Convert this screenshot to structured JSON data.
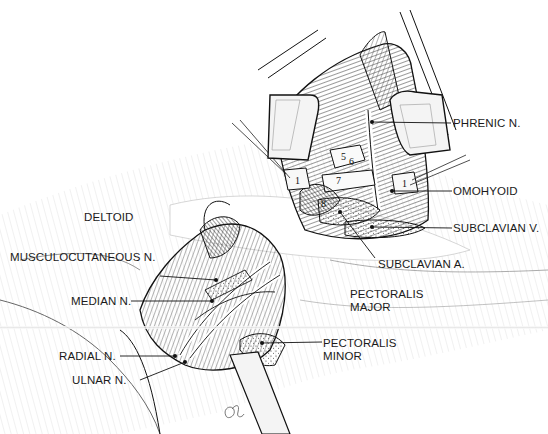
{
  "figure": {
    "type": "anatomical surgical illustration",
    "signature": "artist monogram"
  },
  "labels": {
    "phrenic": "PHRENIC N.",
    "omohyoid": "OMOHYOID",
    "subclavian_v": "SUBCLAVIAN V.",
    "subclavian_a": "SUBCLAVIAN A.",
    "deltoid": "DELTOID",
    "musculocutaneous": "MUSCULOCUTANEOUS N.",
    "median": "MEDIAN N.",
    "pectoralis_major_1": "PECTORALIS",
    "pectoralis_major_2": "MAJOR",
    "pectoralis_minor_1": "PECTORALIS",
    "pectoralis_minor_2": "MINOR",
    "radial": "RADIAL N.",
    "ulnar": "ULNAR N."
  },
  "markers": {
    "m1_left": "1",
    "m1_right": "1",
    "m5": "5",
    "m6": "6",
    "m7": "7",
    "m8": "8"
  },
  "colors": {
    "ink": "#1a1a1a",
    "paper": "#ffffff",
    "retractor_fill": "#f4f4f4"
  }
}
